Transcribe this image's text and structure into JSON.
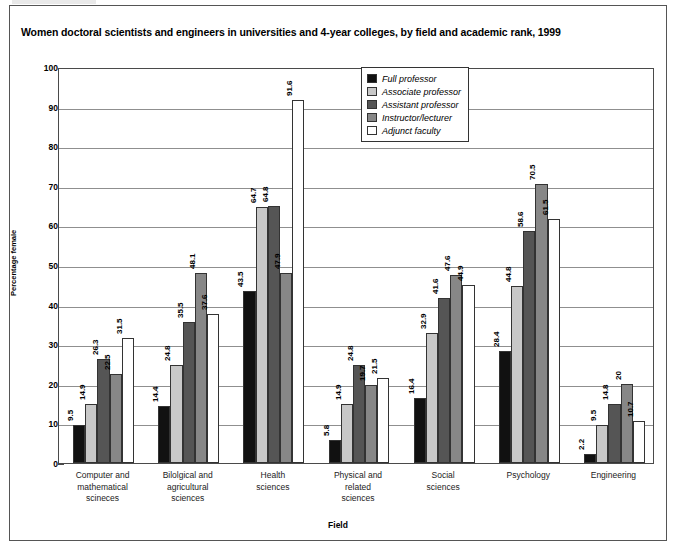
{
  "figure": {
    "title": "Women doctoral scientists and engineers in universities and 4-year colleges, by field and academic rank, 1999"
  },
  "legend": {
    "position": "top-center-right",
    "items": [
      {
        "label": "Full professor",
        "color": "#111111"
      },
      {
        "label": "Associate professor",
        "color": "#c8c8c8"
      },
      {
        "label": "Assistant professor",
        "color": "#555555"
      },
      {
        "label": "Instructor/lecturer",
        "color": "#878787"
      },
      {
        "label": "Adjunct faculty",
        "color": "#ffffff"
      }
    ]
  },
  "axes": {
    "ylabel": "Percentage female",
    "xlabel": "Field",
    "yticks": [
      0,
      10,
      20,
      30,
      40,
      50,
      60,
      70,
      80,
      90,
      100
    ]
  },
  "chart_data": {
    "type": "bar",
    "title": "Women doctoral scientists and engineers in universities and 4-year colleges, by field and academic rank, 1999",
    "xlabel": "Field",
    "ylabel": "Percentage female",
    "ylim": [
      0,
      100
    ],
    "ytick_step": 10,
    "grid": true,
    "legend_position": "top-center-right",
    "categories": [
      "Computer and mathematical scineces",
      "Bilolgical and agricultural sciences",
      "Health sciences",
      "Physical and related sciences",
      "Social sciences",
      "Psychology",
      "Engineering"
    ],
    "category_lines": [
      [
        "Computer and",
        "mathematical",
        "scineces"
      ],
      [
        "Bilolgical and",
        "agricultural",
        "sciences"
      ],
      [
        "Health",
        "sciences"
      ],
      [
        "Physical and",
        "related",
        "sciences"
      ],
      [
        "Social",
        "sciences"
      ],
      [
        "Psychology"
      ],
      [
        "Engineering"
      ]
    ],
    "series": [
      {
        "name": "Full professor",
        "color": "#111111",
        "values": [
          9.5,
          14.4,
          43.5,
          5.8,
          16.4,
          28.4,
          2.2
        ]
      },
      {
        "name": "Associate professor",
        "color": "#c8c8c8",
        "values": [
          14.9,
          24.8,
          64.7,
          14.9,
          32.9,
          44.8,
          9.5
        ]
      },
      {
        "name": "Assistant professor",
        "color": "#555555",
        "values": [
          26.3,
          35.5,
          64.8,
          24.8,
          41.6,
          58.6,
          14.8
        ]
      },
      {
        "name": "Instructor/lecturer",
        "color": "#878787",
        "values": [
          22.5,
          48.1,
          47.9,
          19.7,
          47.6,
          70.5,
          20
        ]
      },
      {
        "name": "Adjunct faculty",
        "color": "#ffffff",
        "values": [
          31.5,
          37.6,
          91.6,
          21.5,
          44.9,
          61.5,
          10.7
        ]
      }
    ],
    "value_labels": [
      [
        "9.5",
        "14.9",
        "26.3",
        "22.5",
        "31.5"
      ],
      [
        "14.4",
        "24.8",
        "35.5",
        "48.1",
        "37.6"
      ],
      [
        "43.5",
        "64.7",
        "64.8",
        "47.9",
        "91.6"
      ],
      [
        "5.8",
        "14.9",
        "24.8",
        "19.7",
        "21.5"
      ],
      [
        "16.4",
        "32.9",
        "41.6",
        "47.6",
        "44.9"
      ],
      [
        "28.4",
        "44.8",
        "58.6",
        "70.5",
        "61.5"
      ],
      [
        "2.2",
        "9.5",
        "14.8",
        "20",
        "10.7"
      ]
    ]
  }
}
